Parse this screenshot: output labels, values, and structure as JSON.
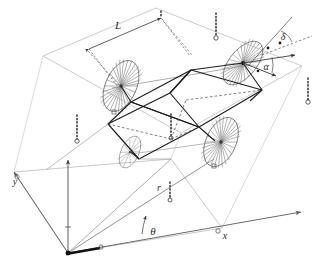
{
  "figure": {
    "background_color": "#ffffff"
  },
  "colors": {
    "body_stroke": "#1a1a1a",
    "plane_stroke": "#a8a8a8",
    "wheel_stroke": "#6e6e6e",
    "axis_stroke": "#5a5a5a",
    "dotted_stroke": "#2e2e2e",
    "label_fill": "#2b2b2b",
    "angle_arc": "#4a4a4a"
  },
  "labels": {
    "wheelbase": {
      "text": "L",
      "x": 118,
      "y": 29
    },
    "steering_angle": {
      "text": "δ",
      "x": 283,
      "y": 39
    },
    "slip_angle": {
      "text": "α",
      "x": 268,
      "y": 68
    },
    "wheel_radius": {
      "text": "r",
      "x": 157,
      "y": 190
    },
    "heading_angle": {
      "text": "θ",
      "x": 148,
      "y": 234
    },
    "axis_x": {
      "text": "x",
      "x": 225,
      "y": 237
    },
    "axis_y": {
      "text": "y",
      "x": 14,
      "y": 183
    }
  },
  "geometry": {
    "ground_plane": {
      "name": "ground-reference-plane",
      "points": "14,172 68,253 222,228 171,159"
    },
    "upper_plane": {
      "name": "upper-reference-plane",
      "points": "43,56 156,8 302,66 181,133"
    },
    "body_outline": {
      "name": "vehicle-body-wedge",
      "top_face": "131,102 193,70 263,90 199,127",
      "lower_front": "108,124 170,93 199,127 139,159",
      "side_left": "108,124 131,102 193,70 170,93",
      "right_panel": "199,127 263,90 250,101 215,141"
    },
    "axle_lines": [
      {
        "name": "front-axle",
        "x1": 115,
        "y1": 85,
        "x2": 250,
        "y2": 68
      },
      {
        "name": "rear-axle",
        "x1": 138,
        "y1": 155,
        "x2": 224,
        "y2": 141
      }
    ],
    "wheels": [
      {
        "name": "wheel-front-left",
        "cx": 121,
        "cy": 86,
        "rx": 16,
        "ry": 27,
        "rotation": 24,
        "spokes": 22
      },
      {
        "name": "wheel-front-right",
        "cx": 243,
        "cy": 63,
        "rx": 14,
        "ry": 26,
        "rotation": 42,
        "spokes": 22
      },
      {
        "name": "wheel-rear-left",
        "cx": 131,
        "cy": 152,
        "rx": 10,
        "ry": 18,
        "rotation": 24,
        "spokes": 18
      },
      {
        "name": "wheel-rear-right",
        "cx": 221,
        "cy": 142,
        "rx": 16,
        "ry": 26,
        "rotation": 24,
        "spokes": 22
      }
    ],
    "height_droplines": [
      {
        "name": "dropline-front-left-outer",
        "x": 77,
        "y1": 115,
        "y2": 141
      },
      {
        "name": "dropline-upper-mid",
        "x": 216,
        "y1": 13,
        "y2": 39
      },
      {
        "name": "dropline-upper-left",
        "x": 160,
        "y1": 11,
        "y2": 18
      },
      {
        "name": "dropline-right-plane",
        "x": 308,
        "y1": 79,
        "y2": 103
      },
      {
        "name": "dropline-body-center",
        "x": 171,
        "y1": 115,
        "y2": 139
      },
      {
        "name": "dropline-radius-r",
        "x": 170,
        "y1": 182,
        "y2": 201
      }
    ],
    "axes": [
      {
        "name": "axis-x-arrow",
        "x1": 68,
        "y1": 253,
        "x2": 301,
        "y2": 212
      },
      {
        "name": "axis-y-arrow",
        "x1": 68,
        "y1": 253,
        "x2": 14,
        "y2": 172
      },
      {
        "name": "heading-ray",
        "x1": 68,
        "y1": 253,
        "x2": 213,
        "y2": 161
      },
      {
        "name": "vertical-guide",
        "x1": 68,
        "y1": 253,
        "x2": 68,
        "y2": 160
      }
    ],
    "angle_arcs": [
      {
        "name": "theta-arc",
        "cx": 68,
        "cy": 253,
        "r": 78,
        "start_deg": -10,
        "end_deg": -32
      },
      {
        "name": "delta-arc",
        "cx": 264,
        "cy": 50,
        "r": 22,
        "start_deg": -70,
        "end_deg": -20
      },
      {
        "name": "alpha-arc",
        "cx": 249,
        "cy": 66,
        "r": 22,
        "start_deg": -48,
        "end_deg": 2
      }
    ]
  }
}
